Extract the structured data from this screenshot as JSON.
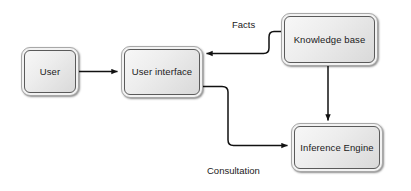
{
  "diagram": {
    "background_color": "#ffffff",
    "node_fill_color": "#ededed",
    "node_border_color": "#5a5a5a",
    "edge_color": "#1a1a1a",
    "nodes": [
      {
        "id": "user",
        "label": "User",
        "x": 21,
        "y": 47,
        "w": 58,
        "h": 49
      },
      {
        "id": "user-interface",
        "label": "User interface",
        "x": 121,
        "y": 46,
        "w": 82,
        "h": 52
      },
      {
        "id": "knowledge-base",
        "label": "Knowledge base",
        "x": 281,
        "y": 13,
        "w": 97,
        "h": 53
      },
      {
        "id": "inference-engine",
        "label": "Inference Engine",
        "x": 291,
        "y": 123,
        "w": 92,
        "h": 49
      }
    ],
    "edges": [
      {
        "id": "user-to-ui",
        "from": "user",
        "to": "user-interface",
        "label": ""
      },
      {
        "id": "kb-to-ui",
        "from": "knowledge-base",
        "to": "user-interface",
        "label": "Facts"
      },
      {
        "id": "kb-to-ie",
        "from": "knowledge-base",
        "to": "inference-engine",
        "label": ""
      },
      {
        "id": "ui-to-ie",
        "from": "user-interface",
        "to": "inference-engine",
        "label": "Consultation"
      }
    ],
    "labels": {
      "facts": "Facts",
      "consultation": "Consultation"
    }
  }
}
